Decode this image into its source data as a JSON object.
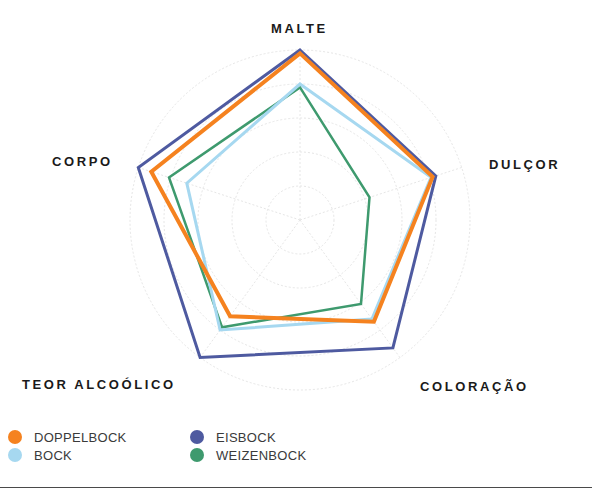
{
  "chart_data": {
    "type": "radar",
    "title": "",
    "axes": [
      "MALTE",
      "DULÇOR",
      "COLORAÇÃO",
      "TEOR ALCOÓLICO",
      "CORPO"
    ],
    "range": [
      0,
      100
    ],
    "grid": {
      "rings": 5,
      "style": "dotted",
      "color": "#e6e6e6"
    },
    "legend_position": "bottom-left",
    "series": [
      {
        "name": "DOPPELBOCK",
        "color": "#F5821F",
        "values": [
          98,
          82,
          74,
          70,
          92
        ]
      },
      {
        "name": "BOCK",
        "color": "#A6D8F0",
        "values": [
          80,
          81,
          72,
          80,
          70
        ]
      },
      {
        "name": "EISBOCK",
        "color": "#4E5AA0",
        "values": [
          100,
          84,
          93,
          100,
          100
        ]
      },
      {
        "name": "WEIZENBOCK",
        "color": "#3E9A6E",
        "values": [
          78,
          43,
          61,
          78,
          81
        ]
      }
    ]
  },
  "labels": {
    "malte": "MALTE",
    "dulcor": "DULÇOR",
    "coloracao": "COLORAÇÃO",
    "teor": "TEOR ALCOÓLICO",
    "corpo": "CORPO"
  },
  "legend": {
    "items": [
      {
        "label": "DOPPELBOCK",
        "color": "#F5821F"
      },
      {
        "label": "BOCK",
        "color": "#A6D8F0"
      },
      {
        "label": "EISBOCK",
        "color": "#4E5AA0"
      },
      {
        "label": "WEIZENBOCK",
        "color": "#3E9A6E"
      }
    ]
  }
}
